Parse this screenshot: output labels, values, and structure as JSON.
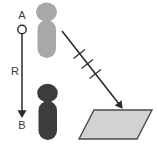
{
  "diagram": {
    "background_color": "#ffffff",
    "labels": {
      "point_a": "A",
      "point_b": "B",
      "distance_r": "R"
    },
    "colors": {
      "light_figure": "#a8a8a8",
      "dark_figure": "#3c3c3c",
      "line": "#2b2b2b",
      "text": "#3a3a3a",
      "plane_fill": "#d2d2d2",
      "plane_stroke": "#4a4a4a",
      "marker_fill": "#ffffff"
    },
    "elements": {
      "point_a_marker": "open-circle-marker",
      "point_b_marker": "arrowhead-marker",
      "vertical_arrow": "downward-arrow",
      "diagonal_arrow": "diagonal-arrow-with-tick-marks",
      "tick_mark_count": 3,
      "plane": "parallelogram-surface",
      "figure_top": "person-silhouette-light",
      "figure_bottom": "person-silhouette-dark"
    }
  }
}
